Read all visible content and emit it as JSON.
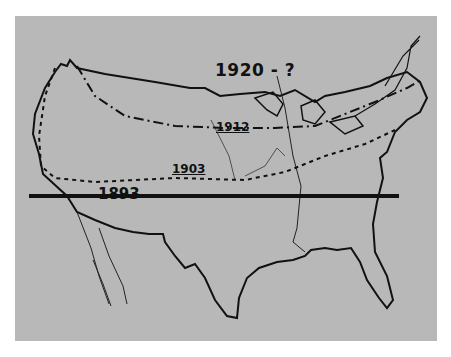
{
  "map": {
    "subject": "United States outline with northward boundary lines by year",
    "labels": {
      "y1920": "1920 - ?",
      "y1912": "1912",
      "y1903": "1903",
      "y1893": "1893"
    },
    "line_styles": {
      "1893": "solid heavy",
      "1903": "dotted",
      "1912": "dash-dot",
      "1920": "unknown"
    },
    "colors": {
      "paper": "#b8b8b8",
      "ink": "#111111",
      "margin": "#ffffff"
    }
  }
}
